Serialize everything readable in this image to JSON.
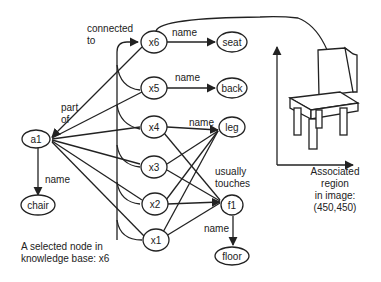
{
  "nodes": {
    "a1": "a1",
    "chair": "chair",
    "x1": "x1",
    "x2": "x2",
    "x3": "x3",
    "x4": "x4",
    "x5": "x5",
    "x6": "x6",
    "seat": "seat",
    "back": "back",
    "leg": "leg",
    "f1": "f1",
    "floor": "floor"
  },
  "edge_labels": {
    "connected_to_line1": "connected",
    "connected_to_line2": "to",
    "part_of_line1": "part",
    "part_of_line2": "of",
    "a1_chair_name": "name",
    "x6_seat_name": "name",
    "x5_back_name": "name",
    "x4_leg_name": "name",
    "usually_touches_line1": "usually",
    "usually_touches_line2": "touches",
    "f1_floor_name": "name"
  },
  "captions": {
    "selected_node_line1": "A selected node in",
    "selected_node_line2": "knowledge base: x6",
    "region_line1": "Associated",
    "region_line2": "region",
    "region_line3": "in image:",
    "region_line4": "(450,450)"
  },
  "colors": {
    "stroke": "#222222",
    "background": "#ffffff"
  }
}
